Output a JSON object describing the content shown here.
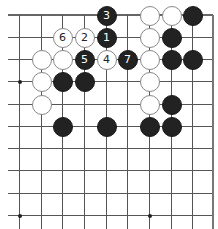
{
  "board": {
    "grid": {
      "x_lines": [
        19,
        41,
        62,
        84,
        106,
        127,
        149,
        171,
        192,
        212
      ],
      "y_lines": [
        15,
        37,
        59,
        81,
        104,
        126,
        148,
        170,
        193,
        215
      ],
      "left_extend": 8,
      "bottom_extend": 229,
      "top_edge": true,
      "right_edge": true
    },
    "hoshi": [
      {
        "col": 0,
        "row": 3
      },
      {
        "col": 0,
        "row": 9
      },
      {
        "col": 6,
        "row": 9
      }
    ],
    "colors": {
      "black_stone": "#222222",
      "white_stone": "#ffffff",
      "white_outline": "#888888",
      "grid_line": "#555555"
    },
    "stones": [
      {
        "color": "black",
        "col": 4,
        "row": 0,
        "label": "3"
      },
      {
        "color": "white",
        "col": 6,
        "row": 0,
        "label": ""
      },
      {
        "color": "white",
        "col": 7,
        "row": 0,
        "label": ""
      },
      {
        "color": "black",
        "col": 8,
        "row": 0,
        "label": ""
      },
      {
        "color": "white",
        "col": 2,
        "row": 1,
        "label": "6"
      },
      {
        "color": "white",
        "col": 3,
        "row": 1,
        "label": "2"
      },
      {
        "color": "black",
        "col": 4,
        "row": 1,
        "label": "1"
      },
      {
        "color": "white",
        "col": 6,
        "row": 1,
        "label": ""
      },
      {
        "color": "black",
        "col": 7,
        "row": 1,
        "label": ""
      },
      {
        "color": "white",
        "col": 1,
        "row": 2,
        "label": ""
      },
      {
        "color": "white",
        "col": 2,
        "row": 2,
        "label": ""
      },
      {
        "color": "black",
        "col": 3,
        "row": 2,
        "label": "5"
      },
      {
        "color": "white",
        "col": 4,
        "row": 2,
        "label": "4"
      },
      {
        "color": "black",
        "col": 5,
        "row": 2,
        "label": "7"
      },
      {
        "color": "white",
        "col": 6,
        "row": 2,
        "label": ""
      },
      {
        "color": "black",
        "col": 7,
        "row": 2,
        "label": ""
      },
      {
        "color": "black",
        "col": 8,
        "row": 2,
        "label": ""
      },
      {
        "color": "white",
        "col": 1,
        "row": 3,
        "label": ""
      },
      {
        "color": "black",
        "col": 2,
        "row": 3,
        "label": ""
      },
      {
        "color": "black",
        "col": 3,
        "row": 3,
        "label": ""
      },
      {
        "color": "white",
        "col": 6,
        "row": 3,
        "label": ""
      },
      {
        "color": "white",
        "col": 1,
        "row": 4,
        "label": ""
      },
      {
        "color": "white",
        "col": 6,
        "row": 4,
        "label": ""
      },
      {
        "color": "black",
        "col": 7,
        "row": 4,
        "label": ""
      },
      {
        "color": "black",
        "col": 2,
        "row": 5,
        "label": ""
      },
      {
        "color": "black",
        "col": 4,
        "row": 5,
        "label": ""
      },
      {
        "color": "black",
        "col": 6,
        "row": 5,
        "label": ""
      },
      {
        "color": "black",
        "col": 7,
        "row": 5,
        "label": ""
      }
    ]
  }
}
